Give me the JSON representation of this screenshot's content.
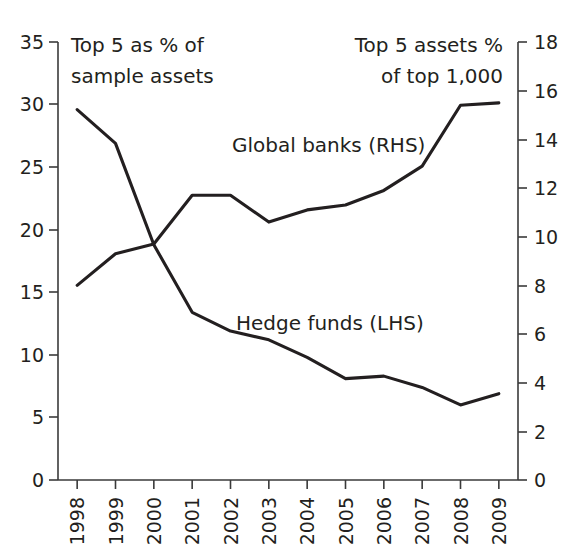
{
  "chart_data": {
    "type": "line",
    "title": "",
    "subtitle": "",
    "xlabel": "",
    "categories": [
      "1998",
      "1999",
      "2000",
      "2001",
      "2002",
      "2003",
      "2004",
      "2005",
      "2006",
      "2007",
      "2008",
      "2009"
    ],
    "grid": false,
    "legend_position": "inline-annotations",
    "axes": {
      "left": {
        "label": "Top 5 as % of sample assets",
        "ylim": [
          0,
          35
        ],
        "ticks": [
          "0",
          "5",
          "10",
          "15",
          "20",
          "25",
          "30",
          "35"
        ],
        "tick_values": [
          0,
          5,
          10,
          15,
          20,
          25,
          30,
          35
        ]
      },
      "right": {
        "label": "Top 5 assets % of top 1,000",
        "ylim": [
          0,
          18
        ],
        "ticks": [
          "0",
          "2",
          "4",
          "6",
          "8",
          "10",
          "12",
          "14",
          "16",
          "18"
        ],
        "tick_values": [
          0,
          2,
          4,
          6,
          8,
          10,
          12,
          14,
          16,
          18
        ]
      }
    },
    "series": [
      {
        "name": "Hedge funds (LHS)",
        "axis": "left",
        "values": [
          29.6,
          26.9,
          18.8,
          13.4,
          11.9,
          11.2,
          9.8,
          8.1,
          8.3,
          7.4,
          6.0,
          6.9
        ]
      },
      {
        "name": "Global banks (RHS)",
        "axis": "right",
        "values": [
          8.0,
          9.3,
          9.7,
          11.7,
          11.7,
          10.6,
          11.1,
          11.3,
          11.9,
          12.9,
          15.4,
          15.5
        ]
      }
    ],
    "annotations": [
      {
        "id": "left-axis-caption-line1",
        "text": "Top 5 as % of"
      },
      {
        "id": "left-axis-caption-line2",
        "text": "sample assets"
      },
      {
        "id": "right-axis-caption-line1",
        "text": "Top 5 assets %"
      },
      {
        "id": "right-axis-caption-line2",
        "text": "of top 1,000"
      },
      {
        "id": "global-banks-label",
        "text": "Global banks (RHS)"
      },
      {
        "id": "hedge-funds-label",
        "text": "Hedge funds (LHS)"
      }
    ],
    "colors": {
      "line": "#231f20",
      "axis": "#3a3a3a",
      "background": "#ffffff",
      "text": "#231f20"
    }
  }
}
